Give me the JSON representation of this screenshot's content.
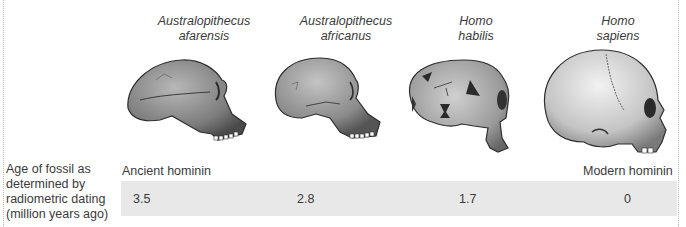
{
  "species": [
    {
      "line1": "Australopithecus",
      "line2": "afarensis",
      "age": "3.5"
    },
    {
      "line1": "Australopithecus",
      "line2": "africanus",
      "age": "2.8"
    },
    {
      "line1": "Homo",
      "line2": "habilis",
      "age": "1.7"
    },
    {
      "line1": "Homo",
      "line2": "sapiens",
      "age": "0"
    }
  ],
  "row_label": {
    "line1": "Age of fossil as",
    "line2": "determined by",
    "line3": "radiometric dating",
    "line4": "(million years ago)"
  },
  "scale": {
    "start_label": "Ancient hominin",
    "end_label": "Modern hominin"
  },
  "colors": {
    "band": "#e8e8e8",
    "text": "#3a3a3a",
    "skull_fill": "#9a9a9a"
  }
}
